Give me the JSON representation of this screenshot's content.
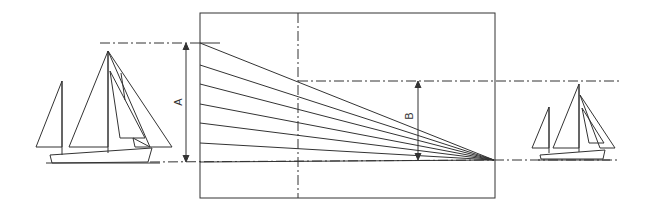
{
  "diagram": {
    "labels": {
      "a": "A",
      "b": "B"
    },
    "colors": {
      "line": "#333333",
      "background": "#ffffff"
    },
    "description_parts": [
      "large-sailboat",
      "perspective-frame",
      "small-sailboat"
    ]
  }
}
